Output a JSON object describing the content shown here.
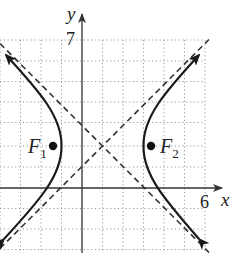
{
  "figure": {
    "type": "hyperbola-graph",
    "axis_labels": {
      "x": "x",
      "y": "y"
    },
    "tick_labels": {
      "x_max": "6",
      "y_max": "7"
    },
    "foci": [
      {
        "label": "F",
        "subscript": "1",
        "x": -1.4,
        "y": 2
      },
      {
        "label": "F",
        "subscript": "2",
        "x": 3.4,
        "y": 2
      }
    ],
    "center": {
      "x": 1,
      "y": 2
    },
    "vertices": [
      {
        "x": -1,
        "y": 2
      },
      {
        "x": 3,
        "y": 2
      }
    ],
    "asymptotes": [
      "y - 2 = (x - 1)",
      "y - 2 = -(x - 1)"
    ],
    "equation": "(x-1)^2/4 - (y-2)^2/4 = 1",
    "grid": {
      "x_range": [
        -4,
        6
      ],
      "y_range": [
        -3,
        7
      ],
      "step": 1,
      "style": "dotted"
    },
    "colors": {
      "curve": "#1a1a1a",
      "asymptote": "#333333",
      "grid": "#9a9a9a",
      "axis": "#333333"
    }
  }
}
